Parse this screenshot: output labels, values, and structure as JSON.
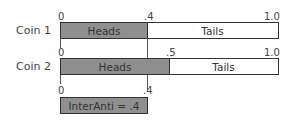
{
  "diagram": {
    "coin1": {
      "label": "Coin 1",
      "ticks": [
        "0",
        ".4",
        "1.0"
      ],
      "heads_label": "Heads",
      "tails_label": "Tails",
      "heads_prob": 0.4
    },
    "coin2": {
      "label": "Coin 2",
      "ticks": [
        "0",
        ".5",
        "1.0"
      ],
      "heads_label": "Heads",
      "tails_label": "Tails",
      "heads_prob": 0.5
    },
    "overlap": {
      "ticks": [
        "0",
        ".4"
      ],
      "label": "InterAnti = .4",
      "value": 0.4
    },
    "colors": {
      "heads_fill": "#8f8f8f",
      "tails_fill": "#ffffff",
      "border": "#333333"
    }
  }
}
